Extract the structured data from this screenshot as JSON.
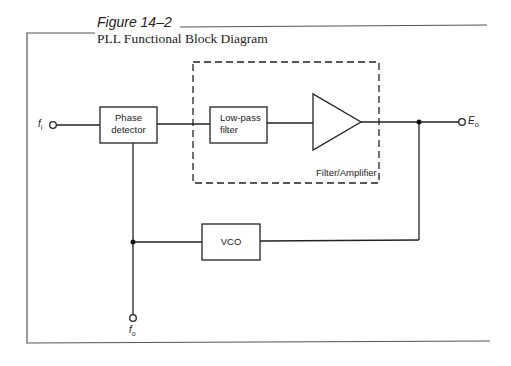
{
  "figure": {
    "label": "Figure 14–2",
    "title": "PLL Functional Block Diagram"
  },
  "blocks": {
    "phase_detector": {
      "line1": "Phase",
      "line2": "detector"
    },
    "low_pass_filter": {
      "line1": "Low-pass",
      "line2": "filter"
    },
    "amplifier": {
      "label": ""
    },
    "vco": {
      "label": "VCO"
    },
    "filter_amplifier_group": {
      "label": "Filter/Amplifier"
    }
  },
  "terminals": {
    "input": {
      "symbol": "f",
      "subscript": "i"
    },
    "output": {
      "symbol": "E",
      "subscript": "o"
    },
    "vco_out": {
      "symbol": "f",
      "subscript": "o"
    }
  },
  "colors": {
    "line": "#222222",
    "frame": "#555555",
    "background": "#ffffff"
  }
}
